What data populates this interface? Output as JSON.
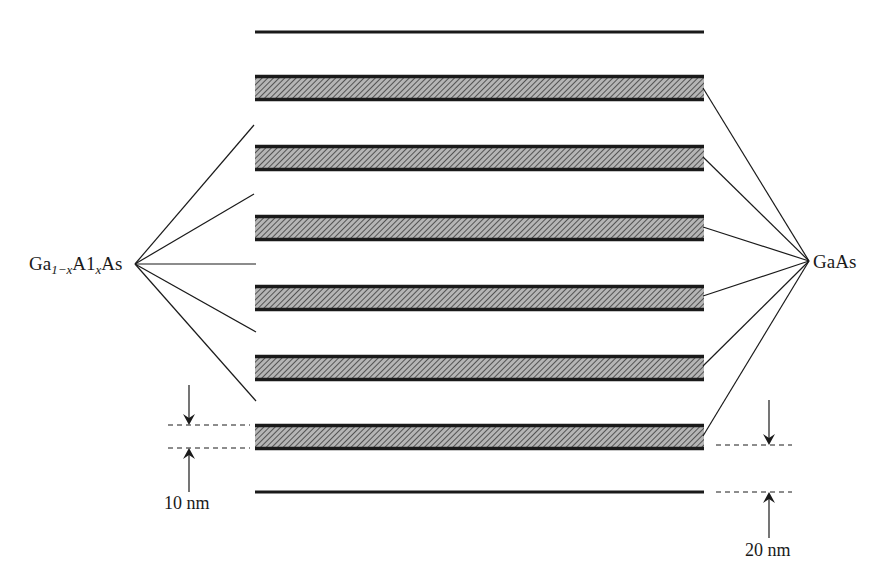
{
  "diagram": {
    "type": "superlattice-layer-structure",
    "left_label": {
      "base": "Ga",
      "sub1": "1−x",
      "mid": "A1",
      "sub2": "x",
      "tail": "As",
      "full": "Ga1−xA1xAs"
    },
    "right_label": "GaAs",
    "dimension_left": "10 nm",
    "dimension_right": "20 nm",
    "colors": {
      "ink": "#1a1a1a",
      "hatch_fill": "#8a8a8a",
      "background": "#ffffff"
    },
    "layers": {
      "x_start": 255,
      "x_end": 704,
      "top_thin_line_y": 32,
      "bottom_thin_line_y": 492,
      "hatched_band_tops": [
        75,
        145,
        215,
        285,
        355,
        424
      ],
      "hatched_band_height": 26
    }
  }
}
